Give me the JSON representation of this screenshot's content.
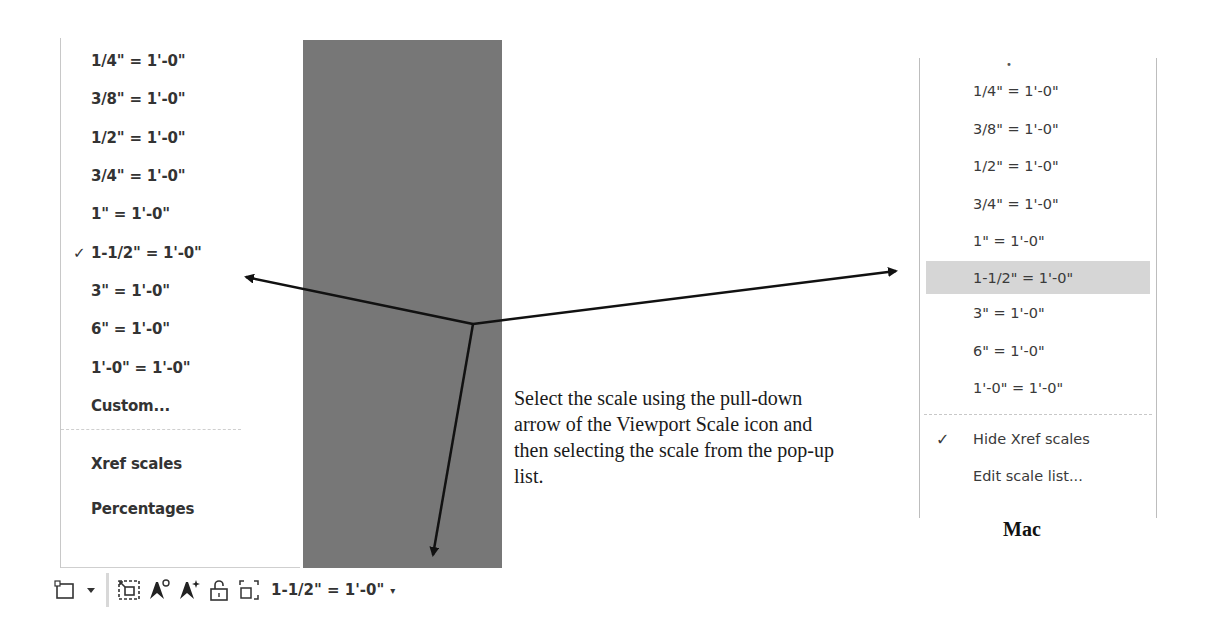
{
  "windows_menu": {
    "items": [
      {
        "label": "1/4\" = 1'-0\"",
        "checked": false
      },
      {
        "label": "3/8\" = 1'-0\"",
        "checked": false
      },
      {
        "label": "1/2\" = 1'-0\"",
        "checked": false
      },
      {
        "label": "3/4\" = 1'-0\"",
        "checked": false
      },
      {
        "label": "1\" = 1'-0\"",
        "checked": false
      },
      {
        "label": "1-1/2\" = 1'-0\"",
        "checked": true
      },
      {
        "label": "3\" = 1'-0\"",
        "checked": false
      },
      {
        "label": "6\" = 1'-0\"",
        "checked": false
      },
      {
        "label": "1'-0\" = 1'-0\"",
        "checked": false
      },
      {
        "label": "Custom...",
        "checked": false
      },
      {
        "label": "Xref scales",
        "checked": false
      },
      {
        "label": "Percentages",
        "checked": false
      }
    ],
    "check_glyph": "✓"
  },
  "toolbar": {
    "icons": [
      "viewport-rectangle-icon",
      "dropdown-caret-icon",
      "maximize-viewport-icon",
      "annotation-visibility-icon",
      "auto-scale-icon",
      "lock-viewport-icon",
      "viewport-scale-icon"
    ],
    "current_scale": "1-1/2\" = 1'-0\"",
    "caret": "▾"
  },
  "caption": {
    "text": "Select the scale using the pull-down arrow of the Viewport Scale icon and then selecting the scale from the pop-up list."
  },
  "mac_menu": {
    "items": [
      {
        "label": "1/4\" = 1'-0\"",
        "selected": false
      },
      {
        "label": "3/8\" = 1'-0\"",
        "selected": false
      },
      {
        "label": "1/2\" = 1'-0\"",
        "selected": false
      },
      {
        "label": "3/4\" = 1'-0\"",
        "selected": false
      },
      {
        "label": "1\" = 1'-0\"",
        "selected": false
      },
      {
        "label": "1-1/2\" = 1'-0\"",
        "selected": true
      },
      {
        "label": "3\" = 1'-0\"",
        "selected": false
      },
      {
        "label": "6\" = 1'-0\"",
        "selected": false
      },
      {
        "label": "1'-0\" = 1'-0\"",
        "selected": false
      }
    ],
    "options": [
      {
        "label": "Hide Xref scales",
        "checked": true
      },
      {
        "label": "Edit scale list...",
        "checked": false
      }
    ],
    "check_glyph": "✓",
    "platform_label": "Mac"
  },
  "colors": {
    "gray_panel": "#777777",
    "mac_selection": "#d6d6d6",
    "text": "#333333"
  }
}
